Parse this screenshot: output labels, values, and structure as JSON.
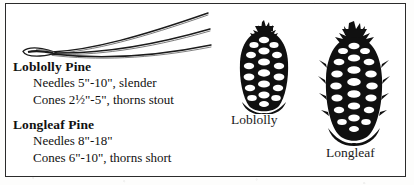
{
  "figure": {
    "kind": "botanical-identification-plate",
    "border_color": "#2b2b2b",
    "ink_color": "#111111",
    "background_color": "#ffffff"
  },
  "needles": {
    "icon": "pine-needle-fascicle-illustration",
    "needle_count": 3,
    "description": "bundle of three long curved pine needles joined at a basal sheath"
  },
  "species": [
    {
      "heading": "Loblolly Pine",
      "lines": [
        "Needles 5\"-10\", slender",
        "Cones 2½\"-5\", thorns stout"
      ]
    },
    {
      "heading": "Longleaf Pine",
      "lines": [
        "Needles 8\"-18\"",
        "Cones 6\"-10\", thorns short"
      ]
    }
  ],
  "cones": [
    {
      "caption": "Loblolly",
      "icon": "pine-cone-illustration",
      "relative_size": "smaller ovoid cone"
    },
    {
      "caption": "Longleaf",
      "icon": "pine-cone-illustration",
      "relative_size": "larger elongated cone"
    }
  ]
}
